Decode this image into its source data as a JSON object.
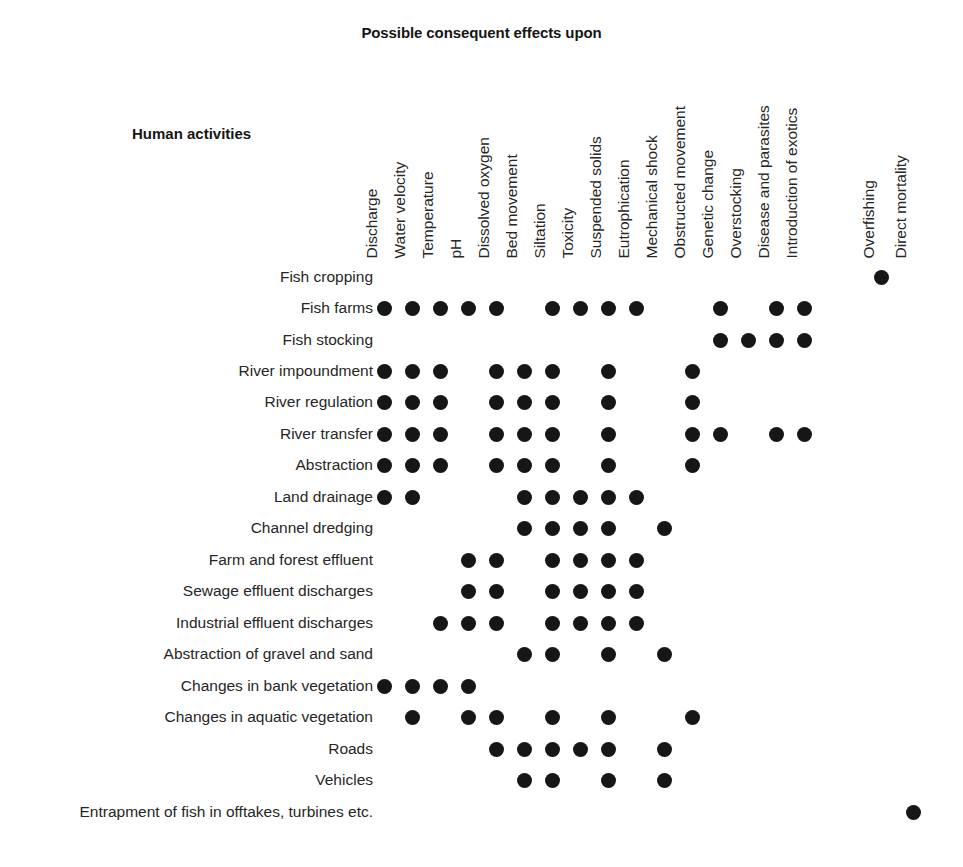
{
  "header": {
    "title": "Possible consequent effects upon",
    "row_axis_title": "Human activities"
  },
  "style": {
    "dot_color": "#161616",
    "text_color": "#262626",
    "background": "#ffffff"
  },
  "chart_data": {
    "type": "heatmap",
    "title": "Possible consequent effects upon",
    "xlabel": "Possible consequent effects upon",
    "ylabel": "Human activities",
    "grid": false,
    "legend": null,
    "notation": "filled circle = effect present",
    "categories": [
      "Discharge",
      "Water velocity",
      "Temperature",
      "pH",
      "Dissolved oxygen",
      "Bed movement",
      "Siltation",
      "Toxicity",
      "Suspended solids",
      "Eutrophication",
      "Mechanical shock",
      "Obstructed movement",
      "Genetic change",
      "Overstocking",
      "Disease and parasites",
      "Introduction of exotics",
      "Overfishing",
      "Direct mortality"
    ],
    "rows": [
      "Fish cropping",
      "Fish farms",
      "Fish stocking",
      "River impoundment",
      "River regulation",
      "River transfer",
      "Abstraction",
      "Land drainage",
      "Channel dredging",
      "Farm and forest effluent",
      "Sewage effluent discharges",
      "Industrial effluent discharges",
      "Abstraction of gravel and sand",
      "Changes in bank vegetation",
      "Changes in aquatic vegetation",
      "Roads",
      "Vehicles",
      "Entrapment of fish in offtakes, turbines etc."
    ],
    "matrix": [
      [
        0,
        0,
        0,
        0,
        0,
        0,
        0,
        0,
        0,
        0,
        0,
        0,
        0,
        0,
        0,
        0,
        1,
        0
      ],
      [
        1,
        1,
        1,
        1,
        1,
        0,
        1,
        1,
        1,
        1,
        0,
        0,
        1,
        0,
        1,
        1,
        0,
        0
      ],
      [
        0,
        0,
        0,
        0,
        0,
        0,
        0,
        0,
        0,
        0,
        0,
        0,
        1,
        1,
        1,
        1,
        0,
        0
      ],
      [
        1,
        1,
        1,
        0,
        1,
        1,
        1,
        0,
        1,
        0,
        0,
        1,
        0,
        0,
        0,
        0,
        0,
        0
      ],
      [
        1,
        1,
        1,
        0,
        1,
        1,
        1,
        0,
        1,
        0,
        0,
        1,
        0,
        0,
        0,
        0,
        0,
        0
      ],
      [
        1,
        1,
        1,
        0,
        1,
        1,
        1,
        0,
        1,
        0,
        0,
        1,
        1,
        0,
        1,
        1,
        0,
        0
      ],
      [
        1,
        1,
        1,
        0,
        1,
        1,
        1,
        0,
        1,
        0,
        0,
        1,
        0,
        0,
        0,
        0,
        0,
        0
      ],
      [
        1,
        1,
        0,
        0,
        0,
        1,
        1,
        1,
        1,
        1,
        0,
        0,
        0,
        0,
        0,
        0,
        0,
        0
      ],
      [
        0,
        0,
        0,
        0,
        0,
        1,
        1,
        1,
        1,
        0,
        1,
        0,
        0,
        0,
        0,
        0,
        0,
        0
      ],
      [
        0,
        0,
        0,
        1,
        1,
        0,
        1,
        1,
        1,
        1,
        0,
        0,
        0,
        0,
        0,
        0,
        0,
        0
      ],
      [
        0,
        0,
        0,
        1,
        1,
        0,
        1,
        1,
        1,
        1,
        0,
        0,
        0,
        0,
        0,
        0,
        0,
        0
      ],
      [
        0,
        0,
        1,
        1,
        1,
        0,
        1,
        1,
        1,
        1,
        0,
        0,
        0,
        0,
        0,
        0,
        0,
        0
      ],
      [
        0,
        0,
        0,
        0,
        0,
        1,
        1,
        0,
        1,
        0,
        1,
        0,
        0,
        0,
        0,
        0,
        0,
        0
      ],
      [
        1,
        1,
        1,
        1,
        0,
        0,
        0,
        0,
        0,
        0,
        0,
        0,
        0,
        0,
        0,
        0,
        0,
        0
      ],
      [
        0,
        1,
        0,
        1,
        1,
        0,
        1,
        0,
        1,
        0,
        0,
        1,
        0,
        0,
        0,
        0,
        0,
        0
      ],
      [
        0,
        0,
        0,
        0,
        1,
        1,
        1,
        1,
        1,
        0,
        1,
        0,
        0,
        0,
        0,
        0,
        0,
        0
      ],
      [
        0,
        0,
        0,
        0,
        0,
        1,
        1,
        0,
        1,
        0,
        1,
        0,
        0,
        0,
        0,
        0,
        0,
        0
      ],
      [
        0,
        0,
        0,
        0,
        0,
        0,
        0,
        0,
        0,
        0,
        0,
        0,
        0,
        0,
        0,
        0,
        0,
        1
      ]
    ],
    "layout": {
      "col_x": [
        384,
        412,
        440,
        468,
        496,
        524,
        552,
        580,
        608,
        636,
        664,
        692,
        720,
        748,
        776,
        804,
        881,
        913
      ],
      "row_y": [
        277,
        308,
        340,
        371,
        402,
        434,
        465,
        497,
        528,
        560,
        591,
        623,
        654,
        686,
        717,
        749,
        780,
        812
      ],
      "label_right_edge": 373,
      "header_baseline_y": 258
    }
  }
}
